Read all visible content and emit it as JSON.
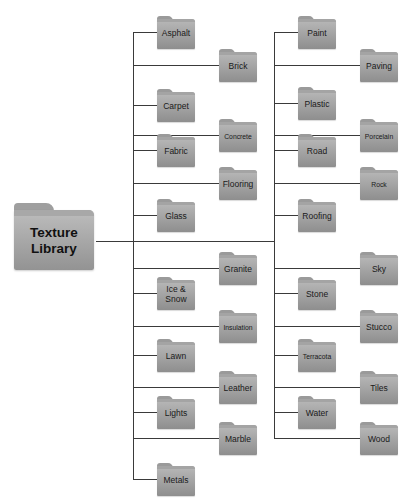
{
  "root": {
    "label": "Texture\nLibrary",
    "line1": "Texture",
    "line2": "Library"
  },
  "left_column": [
    {
      "label": "Asphalt",
      "y": 32,
      "pos": "near"
    },
    {
      "label": "Brick",
      "y": 65,
      "pos": "far"
    },
    {
      "label": "Carpet",
      "y": 105,
      "pos": "near"
    },
    {
      "label": "Concrete",
      "y": 135,
      "pos": "far",
      "small": true
    },
    {
      "label": "Fabric",
      "y": 150,
      "pos": "near"
    },
    {
      "label": "Flooring",
      "y": 183,
      "pos": "far"
    },
    {
      "label": "Glass",
      "y": 215,
      "pos": "near"
    },
    {
      "label": "Granite",
      "y": 268,
      "pos": "far"
    },
    {
      "label": "Ice & Snow",
      "y": 293,
      "pos": "near"
    },
    {
      "label": "Insulation",
      "y": 326,
      "pos": "far",
      "small": true
    },
    {
      "label": "Lawn",
      "y": 355,
      "pos": "near"
    },
    {
      "label": "Leather",
      "y": 387,
      "pos": "far"
    },
    {
      "label": "Lights",
      "y": 412,
      "pos": "near"
    },
    {
      "label": "Marble",
      "y": 438,
      "pos": "far"
    },
    {
      "label": "Metals",
      "y": 479,
      "pos": "near"
    }
  ],
  "right_column": [
    {
      "label": "Paint",
      "y": 32,
      "pos": "near"
    },
    {
      "label": "Paving",
      "y": 65,
      "pos": "far"
    },
    {
      "label": "Plastic",
      "y": 103,
      "pos": "near"
    },
    {
      "label": "Porcelain",
      "y": 135,
      "pos": "far",
      "small": true
    },
    {
      "label": "Road",
      "y": 150,
      "pos": "near"
    },
    {
      "label": "Rock",
      "y": 183,
      "pos": "far",
      "small": true
    },
    {
      "label": "Roofing",
      "y": 215,
      "pos": "near"
    },
    {
      "label": "Sky",
      "y": 268,
      "pos": "far"
    },
    {
      "label": "Stone",
      "y": 293,
      "pos": "near"
    },
    {
      "label": "Stucco",
      "y": 326,
      "pos": "far"
    },
    {
      "label": "Terracota",
      "y": 355,
      "pos": "near",
      "small": true
    },
    {
      "label": "Tiles",
      "y": 387,
      "pos": "far"
    },
    {
      "label": "Water",
      "y": 412,
      "pos": "near"
    },
    {
      "label": "Wood",
      "y": 438,
      "pos": "far"
    }
  ],
  "colors": {
    "line": "#3a3a3a",
    "folder_top": "#b9b9b9",
    "folder_bottom": "#8e8e8e",
    "text": "#1a1a1a"
  }
}
